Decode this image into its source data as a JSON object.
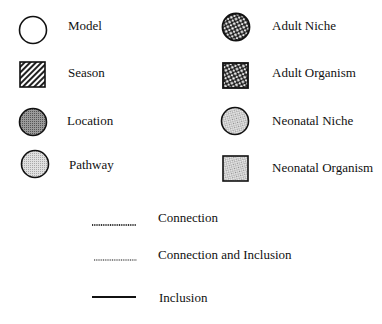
{
  "legend": {
    "left_column": [
      {
        "label": "Model",
        "icon": "open-circle-icon"
      },
      {
        "label": "Season",
        "icon": "hatched-square-icon"
      },
      {
        "label": "Location",
        "icon": "dark-gray-circle-icon"
      },
      {
        "label": "Pathway",
        "icon": "light-gray-circle-icon"
      }
    ],
    "right_column": [
      {
        "label": "Adult Niche",
        "icon": "coarse-dotted-circle-icon"
      },
      {
        "label": "Adult Organism",
        "icon": "coarse-dotted-square-icon"
      },
      {
        "label": "Neonatal Niche",
        "icon": "fine-dotted-circle-icon"
      },
      {
        "label": "Neonatal Organism",
        "icon": "fine-dotted-square-icon"
      }
    ],
    "lines": [
      {
        "label": "Connection",
        "style": "dark-dotted-line"
      },
      {
        "label": "Connection and Inclusion",
        "style": "light-dotted-line"
      },
      {
        "label": "Inclusion",
        "style": "solid-line"
      }
    ]
  },
  "colors": {
    "stroke": "#111111",
    "location_fill": "#8a8a8a",
    "pathway_fill": "#cfcfcf"
  }
}
